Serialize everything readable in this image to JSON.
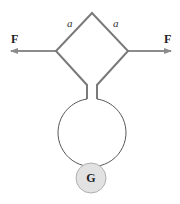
{
  "diagram": {
    "labels": {
      "side_left": "a",
      "side_right": "a",
      "force_left": "F",
      "force_right": "F",
      "galvanometer": "G"
    },
    "colors": {
      "frame": "#7a7a7a",
      "arrow": "#8c8c8c",
      "loop": "#444444",
      "galvanometer_fill": "#e2e2e2",
      "galvanometer_stroke": "#b0b0b0"
    }
  }
}
